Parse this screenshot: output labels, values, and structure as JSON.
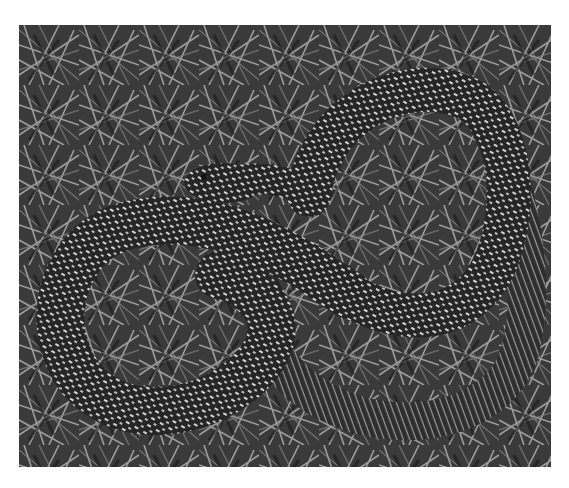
{
  "image": {
    "subject": "snake coiled on dry grass",
    "style": "grayscale photograph",
    "colors": {
      "background": "#ffffff",
      "grass_dark": "#1a1a1a",
      "grass_light": "#d8d8d8",
      "snake_body": "#2b2b2b",
      "snake_pattern": "#cfcfcf"
    }
  }
}
